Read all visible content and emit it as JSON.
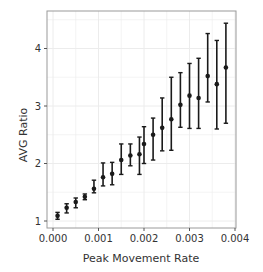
{
  "chart_data": {
    "type": "scatter",
    "title": "",
    "xlabel": "Peak Movement Rate",
    "ylabel": "AVG Ratio",
    "xlim": [
      -0.0002,
      0.004
    ],
    "ylim": [
      0.96,
      4.6
    ],
    "grid": true,
    "legend": null,
    "x_ticks": [
      0.0,
      0.001,
      0.002,
      0.003,
      0.004
    ],
    "x_tick_labels": [
      "0.000",
      "0.001",
      "0.002",
      "0.003",
      "0.004"
    ],
    "y_ticks": [
      1,
      2,
      3,
      4
    ],
    "y_tick_labels": [
      "1",
      "2",
      "3",
      "4"
    ],
    "series": [
      {
        "name": "AVG Ratio",
        "marker": "circle",
        "error_bars": true,
        "x": [
          0.0001,
          0.0003,
          0.0005,
          0.0007,
          0.0009,
          0.0011,
          0.0013,
          0.0015,
          0.0017,
          0.0019,
          0.002,
          0.0022,
          0.0024,
          0.0026,
          0.0028,
          0.003,
          0.0032,
          0.0034,
          0.0036,
          0.0038
        ],
        "y": [
          1.09,
          1.23,
          1.33,
          1.42,
          1.56,
          1.76,
          1.82,
          2.06,
          2.14,
          2.16,
          2.34,
          2.5,
          2.62,
          2.77,
          3.02,
          3.18,
          3.14,
          3.52,
          3.38,
          3.67
        ],
        "y_low": [
          1.03,
          1.14,
          1.23,
          1.37,
          1.49,
          1.61,
          1.63,
          1.81,
          1.96,
          1.81,
          2.0,
          2.06,
          2.22,
          2.23,
          2.63,
          2.61,
          2.61,
          3.07,
          2.6,
          2.7
        ],
        "y_high": [
          1.15,
          1.3,
          1.4,
          1.47,
          1.71,
          2.01,
          2.02,
          2.34,
          2.34,
          2.46,
          2.64,
          2.79,
          3.14,
          3.5,
          3.58,
          3.74,
          3.83,
          4.26,
          4.14,
          4.44
        ]
      }
    ]
  },
  "style": {
    "point_color": "#1a1a1a",
    "grid_color": "#ececec",
    "frame_color": "#9a9a9a"
  }
}
